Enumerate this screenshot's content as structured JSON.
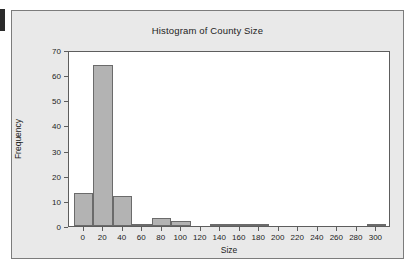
{
  "chart_data": {
    "type": "bar",
    "title": "Histogram of County Size",
    "xlabel": "Size",
    "ylabel": "Frequency",
    "xlim": [
      -15,
      315
    ],
    "ylim": [
      0,
      70
    ],
    "grid": false,
    "legend": null,
    "bin_width": 20,
    "bar_color": "#b3b3b3",
    "bar_edge_color": "#6b6b6b",
    "plot_background": "#ffffff",
    "figure_background": "#e9e9e9",
    "categories": [
      0,
      20,
      40,
      60,
      80,
      100,
      120,
      140,
      160,
      180,
      200,
      220,
      240,
      260,
      280,
      300
    ],
    "values": [
      13,
      64,
      12,
      1,
      3,
      2,
      0,
      1,
      1,
      1,
      0,
      0,
      0,
      0,
      0,
      1
    ],
    "xticks": [
      0,
      20,
      40,
      60,
      80,
      100,
      120,
      140,
      160,
      180,
      200,
      220,
      240,
      260,
      280,
      300
    ],
    "xticklabels": [
      "0",
      "20",
      "40",
      "60",
      "80",
      "100",
      "120",
      "140",
      "160",
      "180",
      "200",
      "220",
      "240",
      "260",
      "280",
      "300"
    ],
    "yticks": [
      0,
      10,
      20,
      30,
      40,
      50,
      60,
      70
    ],
    "yticklabels": [
      "0",
      "10",
      "20",
      "30",
      "40",
      "50",
      "60",
      "70"
    ]
  }
}
